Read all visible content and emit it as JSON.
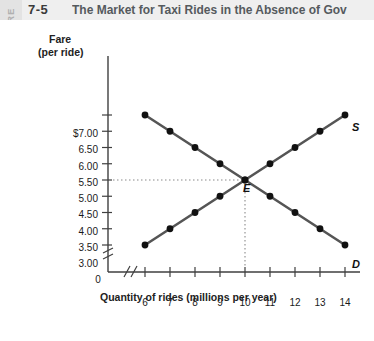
{
  "figure": {
    "tab_word": "FIGURE",
    "number": "7-5",
    "title": "The Market for Taxi Rides in the Absence of Gov"
  },
  "chart_data": {
    "type": "line",
    "title": "The Market for Taxi Rides in the Absence of Gov",
    "xlabel": "Quantity of rides (millions per year)",
    "ylabel": "Fare (per ride)",
    "ylabel_line1": "Fare",
    "ylabel_line2": "(per ride)",
    "x": [
      6,
      7,
      8,
      9,
      10,
      11,
      12,
      13,
      14
    ],
    "xtick_labels": [
      "6",
      "7",
      "8",
      "9",
      "10",
      "11",
      "12",
      "13",
      "14"
    ],
    "x_origin_label": "0",
    "ytick_values": [
      3.0,
      3.5,
      4.0,
      4.5,
      5.0,
      5.5,
      6.0,
      6.5,
      7.0
    ],
    "ytick_labels": [
      "3.00",
      "3.50",
      "4.00",
      "4.50",
      "5.00",
      "5.50",
      "6.00",
      "6.50",
      "$7.00"
    ],
    "xlim": [
      6,
      14
    ],
    "ylim": [
      3.0,
      7.0
    ],
    "grid": false,
    "axis_break_x": true,
    "axis_break_y": true,
    "legend_position": "inline-curve-ends",
    "series": [
      {
        "name": "Supply",
        "label": "S",
        "values": [
          3.0,
          3.5,
          4.0,
          4.5,
          5.0,
          5.5,
          6.0,
          6.5,
          7.0
        ],
        "color": "#555555",
        "marker_color": "#111111"
      },
      {
        "name": "Demand",
        "label": "D",
        "values": [
          7.0,
          6.5,
          6.0,
          5.5,
          5.0,
          4.5,
          4.0,
          3.5,
          3.0
        ],
        "color": "#555555",
        "marker_color": "#111111"
      }
    ],
    "annotations": [
      {
        "name": "equilibrium",
        "label": "E",
        "x": 10,
        "y": 5.0,
        "guide_lines": "dotted-to-axes"
      }
    ]
  },
  "colors": {
    "header_band": "#efefef",
    "figure_tab": "#e3e3e3",
    "title_text": "#555a5e",
    "axis": "#3f3f3f",
    "curve": "#555555",
    "marker": "#111111",
    "guide": "#8a8a8a"
  }
}
